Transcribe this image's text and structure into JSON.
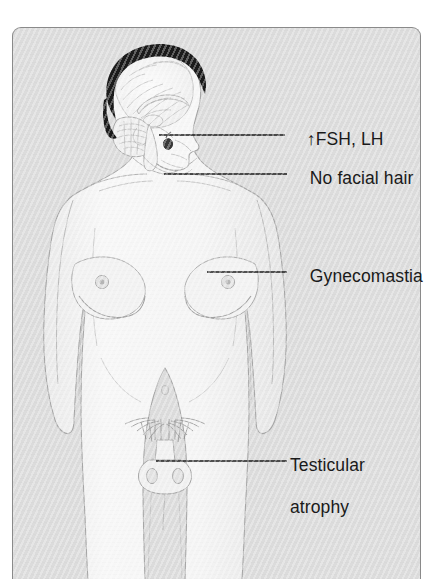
{
  "figure": {
    "background_color": "#dcdcdc",
    "border_color": "#8a8a8a",
    "skin_color": "#f4f4f4",
    "outline_color": "#9a9a9a",
    "hair_color": "#1c1c1c",
    "leader_line_color": "#1a1a1a"
  },
  "annotations": [
    {
      "id": "fsh-lh",
      "name": "fsh-lh-label",
      "text": "↑FSH, LH",
      "arrow": "↑",
      "body_text": "FSH, LH",
      "points_to": "pituitary-gland",
      "leader": {
        "x1": 158,
        "y1": 119,
        "x2": 284,
        "y2": 119
      },
      "label_x": 287,
      "label_y": 108
    },
    {
      "id": "no-facial-hair",
      "name": "no-facial-hair-label",
      "text": "No facial hair",
      "points_to": "jaw-chin",
      "leader": {
        "x1": 163,
        "y1": 158,
        "x2": 286,
        "y2": 158
      },
      "label_x": 290,
      "label_y": 147
    },
    {
      "id": "gynecomastia",
      "name": "gynecomastia-label",
      "text": "Gynecomastia",
      "points_to": "left-breast",
      "leader": {
        "x1": 206,
        "y1": 256,
        "x2": 286,
        "y2": 256
      },
      "label_x": 290,
      "label_y": 245
    },
    {
      "id": "testicular-atrophy",
      "name": "testicular-atrophy-label",
      "text": "Testicular\natrophy",
      "line1": "Testicular",
      "line2": "atrophy",
      "points_to": "testes",
      "leader": {
        "x1": 155,
        "y1": 445,
        "x2": 286,
        "y2": 445
      },
      "label_x": 290,
      "label_y": 434
    }
  ],
  "anatomy": [
    {
      "name": "scalp-hair",
      "description": "dark hair over cranium"
    },
    {
      "name": "brain-sagittal-section",
      "description": "midsagittal brain with cerebrum, corpus callosum, cerebellum, brainstem"
    },
    {
      "name": "pituitary-gland",
      "description": "small dark gland at sella turcica"
    },
    {
      "name": "face",
      "description": "smooth beardless profile"
    },
    {
      "name": "neck",
      "description": "neck with clavicles below"
    },
    {
      "name": "left-breast",
      "description": "enlarged breast with nipple"
    },
    {
      "name": "right-breast",
      "description": "enlarged breast with nipple"
    },
    {
      "name": "navel",
      "description": "umbilicus"
    },
    {
      "name": "pubic-hair",
      "description": "sparse female-pattern pubic hair"
    },
    {
      "name": "penis",
      "description": "small phallus"
    },
    {
      "name": "testes",
      "description": "small atrophic testes in scrotum"
    },
    {
      "name": "left-arm",
      "description": "arm hanging at side"
    },
    {
      "name": "right-arm",
      "description": "arm hanging at side"
    },
    {
      "name": "legs",
      "description": "thighs tapering downward"
    }
  ]
}
